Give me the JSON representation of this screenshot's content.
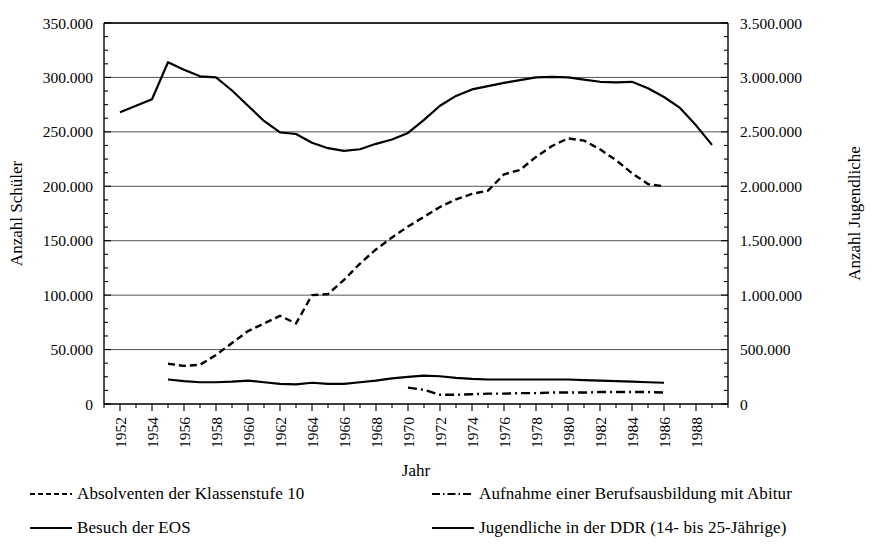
{
  "chart_data": {
    "type": "line",
    "title": "",
    "xlabel": "Jahr",
    "ylabel": "Anzahl Schüler",
    "y2label": "Anzahl Jugendliche",
    "xlim": [
      1951,
      1990
    ],
    "ylim": [
      0,
      350000
    ],
    "y2lim": [
      0,
      3500000
    ],
    "grid": true,
    "legend_position": "below",
    "xticks": [
      1952,
      1954,
      1956,
      1958,
      1960,
      1962,
      1964,
      1966,
      1968,
      1970,
      1972,
      1974,
      1976,
      1978,
      1980,
      1982,
      1984,
      1986,
      1988
    ],
    "xtick_labels": [
      "1952",
      "1954",
      "1956",
      "1958",
      "1960",
      "1962",
      "1964",
      "1966",
      "1968",
      "1970",
      "1972",
      "1974",
      "1976",
      "1978",
      "1980",
      "1982",
      "1984",
      "1986",
      "1988"
    ],
    "yticks": [
      0,
      50000,
      100000,
      150000,
      200000,
      250000,
      300000,
      350000
    ],
    "ytick_labels": [
      "0",
      "50.000",
      "100.000",
      "150.000",
      "200.000",
      "250.000",
      "300.000",
      "350.000"
    ],
    "y2ticks": [
      0,
      500000,
      1000000,
      1500000,
      2000000,
      2500000,
      3000000,
      3500000
    ],
    "y2tick_labels": [
      "0",
      "500.000",
      "1.000.000",
      "1.500.000",
      "2.000.000",
      "2.500.000",
      "3.000.000",
      "3.500.000"
    ],
    "series": [
      {
        "name": "Absolventen der Klassenstufe 10",
        "style": "dashed",
        "axis": "left",
        "color": "#000000",
        "x": [
          1955,
          1956,
          1957,
          1958,
          1959,
          1960,
          1961,
          1962,
          1963,
          1964,
          1965,
          1966,
          1967,
          1968,
          1969,
          1970,
          1971,
          1972,
          1973,
          1974,
          1975,
          1976,
          1977,
          1978,
          1979,
          1980,
          1981,
          1982,
          1983,
          1984,
          1985,
          1986
        ],
        "values": [
          37000,
          35000,
          36000,
          45000,
          56000,
          67000,
          74000,
          81000,
          74000,
          100000,
          101000,
          114000,
          129000,
          142000,
          153000,
          163000,
          172000,
          181000,
          188000,
          193000,
          196000,
          211000,
          215000,
          227000,
          237000,
          244000,
          242000,
          234000,
          224000,
          212000,
          202000,
          200000
        ]
      },
      {
        "name": "Aufnahme einer Berufsausbildung mit Abitur",
        "style": "dashdot",
        "axis": "left",
        "color": "#000000",
        "x": [
          1970,
          1971,
          1972,
          1973,
          1974,
          1975,
          1976,
          1977,
          1978,
          1979,
          1980,
          1981,
          1982,
          1983,
          1984,
          1985,
          1986
        ],
        "values": [
          15000,
          13000,
          8500,
          8500,
          9000,
          9500,
          9500,
          10000,
          10000,
          10500,
          10500,
          10500,
          11000,
          11000,
          11000,
          11000,
          10500
        ]
      },
      {
        "name": "Besuch der EOS",
        "style": "solid",
        "axis": "left",
        "color": "#000000",
        "x": [
          1955,
          1956,
          1957,
          1958,
          1959,
          1960,
          1961,
          1962,
          1963,
          1964,
          1965,
          1966,
          1967,
          1968,
          1969,
          1970,
          1971,
          1972,
          1973,
          1974,
          1975,
          1976,
          1977,
          1978,
          1979,
          1980,
          1981,
          1982,
          1983,
          1984,
          1985,
          1986
        ],
        "values": [
          22500,
          21000,
          20000,
          20000,
          20500,
          21500,
          20000,
          18500,
          18000,
          19500,
          18500,
          18500,
          20000,
          21500,
          23500,
          25000,
          26000,
          25500,
          24000,
          23000,
          22500,
          22500,
          22500,
          22500,
          22500,
          22500,
          22000,
          21500,
          21000,
          20500,
          20000,
          19500
        ]
      },
      {
        "name": "Jugendliche in der DDR (14- bis 25-Jährige)",
        "style": "solid",
        "axis": "right",
        "color": "#000000",
        "x": [
          1952,
          1953,
          1954,
          1955,
          1956,
          1957,
          1958,
          1959,
          1960,
          1961,
          1962,
          1963,
          1964,
          1965,
          1966,
          1967,
          1968,
          1969,
          1970,
          1971,
          1972,
          1973,
          1974,
          1975,
          1976,
          1977,
          1978,
          1979,
          1980,
          1981,
          1982,
          1983,
          1984,
          1985,
          1986,
          1987,
          1988,
          1989
        ],
        "values": [
          2680000,
          2740000,
          2800000,
          3140000,
          3070000,
          3010000,
          3000000,
          2880000,
          2740000,
          2600000,
          2495000,
          2480000,
          2400000,
          2350000,
          2325000,
          2340000,
          2390000,
          2430000,
          2490000,
          2610000,
          2740000,
          2830000,
          2890000,
          2920000,
          2950000,
          2975000,
          3000000,
          3005000,
          3000000,
          2980000,
          2960000,
          2955000,
          2960000,
          2900000,
          2820000,
          2720000,
          2560000,
          2380000
        ]
      }
    ]
  },
  "legend": {
    "items": [
      {
        "label": "Absolventen der Klassenstufe 10",
        "style": "dashed"
      },
      {
        "label": "Aufnahme einer Berufsausbildung mit Abitur",
        "style": "dashdot"
      },
      {
        "label": "Besuch der EOS",
        "style": "solid"
      },
      {
        "label": "Jugendliche in der DDR (14- bis 25-Jährige)",
        "style": "solid"
      }
    ]
  },
  "colors": {
    "ink": "#000000",
    "grid": "#555555",
    "background": "#ffffff"
  }
}
